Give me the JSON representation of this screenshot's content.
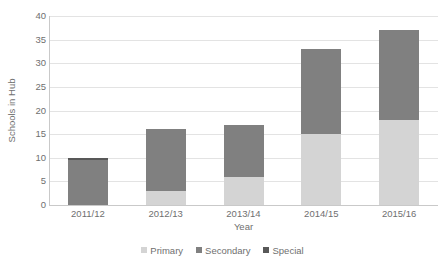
{
  "chart_data": {
    "type": "bar",
    "stacked": true,
    "title": "",
    "xlabel": "Year",
    "ylabel": "Schools in Hub",
    "categories": [
      "2011/12",
      "2012/13",
      "2013/14",
      "2014/15",
      "2015/16"
    ],
    "series": [
      {
        "name": "Primary",
        "color": "#d4d4d4",
        "values": [
          0,
          3,
          6,
          15,
          18
        ]
      },
      {
        "name": "Secondary",
        "color": "#808080",
        "values": [
          9.5,
          13,
          11,
          18,
          19
        ]
      },
      {
        "name": "Special",
        "color": "#585858",
        "values": [
          0.5,
          0,
          0,
          0,
          0
        ]
      }
    ],
    "totals": [
      10,
      16,
      17,
      33,
      37
    ],
    "ylim": [
      0,
      40
    ],
    "ytick_step": 5,
    "ytick_labels": [
      "0",
      "5",
      "10",
      "15",
      "20",
      "25",
      "30",
      "35",
      "40"
    ],
    "grid": true,
    "legend_position": "bottom"
  },
  "legend": {
    "entries": [
      {
        "label": "Primary",
        "color": "#d4d4d4"
      },
      {
        "label": "Secondary",
        "color": "#808080"
      },
      {
        "label": "Special",
        "color": "#585858"
      }
    ]
  },
  "axes": {
    "y_title": "Schools in Hub",
    "x_title": "Year"
  }
}
